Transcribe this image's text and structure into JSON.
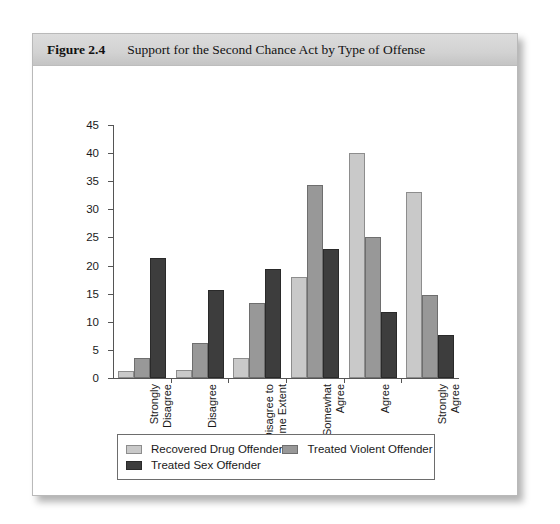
{
  "figure": {
    "number": "Figure 2.4",
    "title": "Support for the Second Chance Act by Type of Offense"
  },
  "chart_data": {
    "type": "bar",
    "title": "Support for the Second Chance Act by Type of Offense",
    "xlabel": "",
    "ylabel": "",
    "ylim": [
      0,
      45
    ],
    "ytick_step": 5,
    "yticks": [
      0,
      5,
      10,
      15,
      20,
      25,
      30,
      35,
      40,
      45
    ],
    "grid": false,
    "legend_position": "bottom",
    "categories": [
      "Strongly Disagree",
      "Disagree",
      "Disagree to Some Extent",
      "Somewhat Agree",
      "Agree",
      "Strongly Agree"
    ],
    "series": [
      {
        "name": "Recovered Drug Offender",
        "color": "#c9c9c9",
        "values": [
          1.3,
          1.5,
          3.5,
          18.0,
          40.0,
          33.0
        ]
      },
      {
        "name": "Treated Violent Offender",
        "color": "#989898",
        "values": [
          3.5,
          6.3,
          13.3,
          34.3,
          25.0,
          14.7
        ]
      },
      {
        "name": "Treated Sex Offender",
        "color": "#3d3d3d",
        "values": [
          21.3,
          15.7,
          19.4,
          23.0,
          11.7,
          7.7
        ]
      }
    ]
  }
}
